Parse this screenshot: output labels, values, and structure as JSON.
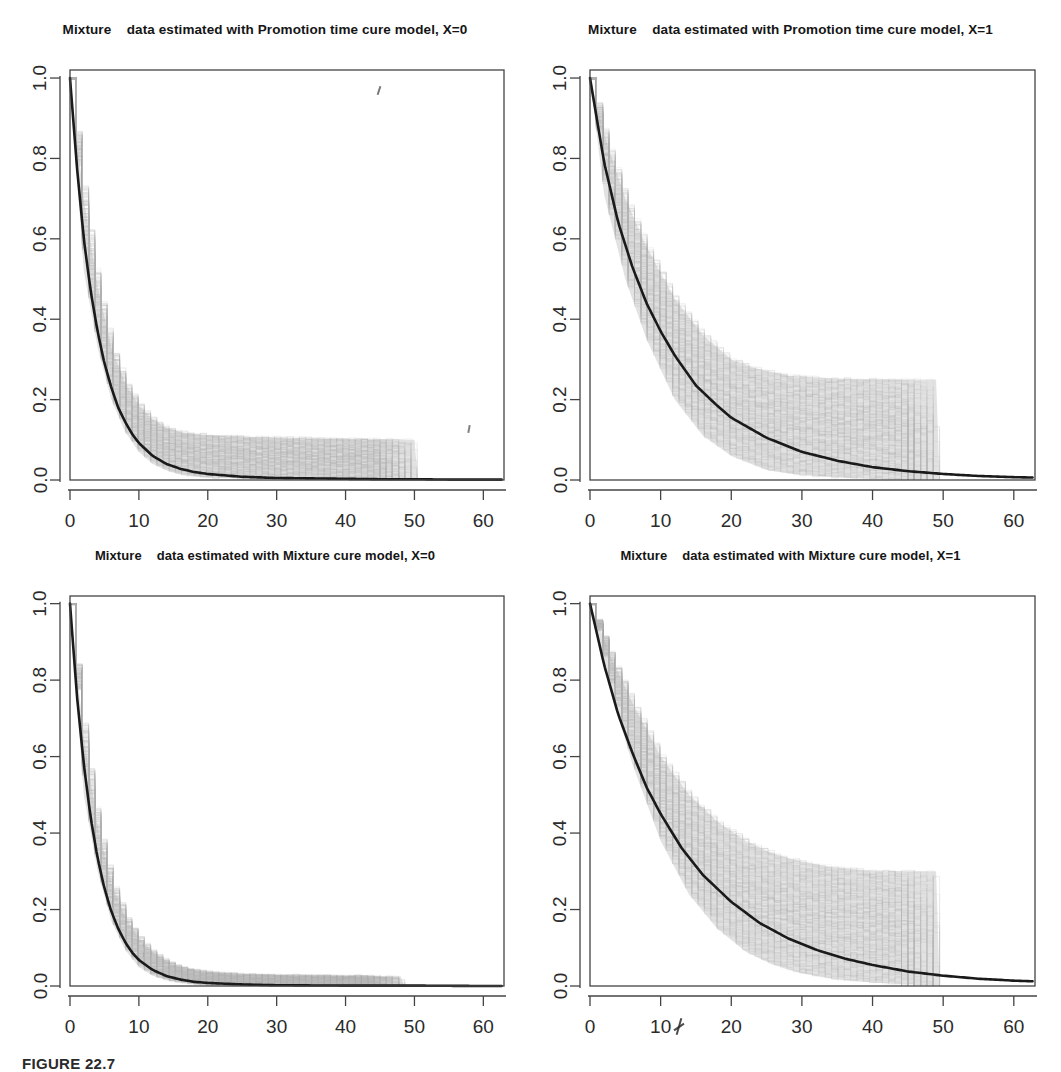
{
  "figure": {
    "caption": "FIGURE 22.7",
    "axis_labels": {
      "x_ticks": [
        "0",
        "10",
        "20",
        "30",
        "40",
        "50",
        "60"
      ],
      "y_ticks": [
        "0.0",
        "0.2",
        "0.4",
        "0.6",
        "0.8",
        "1.0"
      ]
    },
    "colors": {
      "curve": "#1a1a1a",
      "band": "#b9b9b9",
      "axis": "#444444",
      "background": "#ffffff"
    }
  },
  "panels": [
    {
      "id": "promotion-x0",
      "title": "Mixture    data estimated with Promotion time cure model, X=0"
    },
    {
      "id": "promotion-x1",
      "title": "Mixture    data estimated with Promotion time cure model, X=1"
    },
    {
      "id": "mixture-x0",
      "title": "Mixture    data estimated with Mixture cure model, X=0"
    },
    {
      "id": "mixture-x1",
      "title": "Mixture    data estimated with Mixture cure model, X=1"
    }
  ],
  "chart_data": [
    {
      "type": "line",
      "title": "Mixture    data estimated with Promotion time cure model, X=0",
      "xlabel": "",
      "ylabel": "",
      "xlim": [
        0,
        63
      ],
      "ylim": [
        0,
        1.02
      ],
      "xticks": [
        0,
        10,
        20,
        30,
        40,
        50,
        60
      ],
      "yticks": [
        0.0,
        0.2,
        0.4,
        0.6,
        0.8,
        1.0
      ],
      "grid": false,
      "legend": "none",
      "series": [
        {
          "name": "Fitted survival curve",
          "style": "solid-black",
          "x": [
            0,
            1,
            2,
            3,
            4,
            5,
            6,
            7,
            8,
            9,
            10,
            12,
            14,
            16,
            18,
            20,
            25,
            30,
            35,
            40,
            45,
            50,
            55,
            60,
            63
          ],
          "values": [
            1.0,
            0.78,
            0.6,
            0.47,
            0.37,
            0.29,
            0.23,
            0.18,
            0.145,
            0.115,
            0.092,
            0.06,
            0.04,
            0.028,
            0.02,
            0.015,
            0.008,
            0.005,
            0.004,
            0.003,
            0.002,
            0.002,
            0.001,
            0.001,
            0.001
          ]
        },
        {
          "name": "Bootstrap band upper",
          "style": "grey-envelope",
          "x": [
            0,
            2,
            4,
            6,
            8,
            10,
            12,
            14,
            16,
            18,
            20,
            25,
            30,
            35,
            40,
            45,
            50,
            50.5,
            63
          ],
          "values": [
            1.0,
            0.7,
            0.48,
            0.33,
            0.24,
            0.185,
            0.15,
            0.13,
            0.12,
            0.115,
            0.112,
            0.108,
            0.106,
            0.104,
            0.103,
            0.102,
            0.1,
            0.0,
            0.0
          ]
        },
        {
          "name": "Bootstrap band lower",
          "style": "grey-envelope",
          "x": [
            0,
            2,
            4,
            6,
            8,
            10,
            12,
            14,
            16,
            18,
            20,
            30,
            40,
            50,
            63
          ],
          "values": [
            1.0,
            0.52,
            0.33,
            0.2,
            0.12,
            0.07,
            0.04,
            0.024,
            0.014,
            0.009,
            0.006,
            0.002,
            0.001,
            0.0,
            0.0
          ]
        }
      ],
      "annotations": [
        "grey bootstrap replicate step-curves truncate at t = 50"
      ]
    },
    {
      "type": "line",
      "title": "Mixture    data estimated with Promotion time cure model, X=1",
      "xlabel": "",
      "ylabel": "",
      "xlim": [
        0,
        63
      ],
      "ylim": [
        0,
        1.02
      ],
      "xticks": [
        0,
        10,
        20,
        30,
        40,
        50,
        60
      ],
      "yticks": [
        0.0,
        0.2,
        0.4,
        0.6,
        0.8,
        1.0
      ],
      "grid": false,
      "legend": "none",
      "series": [
        {
          "name": "Fitted survival curve",
          "style": "solid-black",
          "x": [
            0,
            2,
            4,
            6,
            8,
            10,
            12,
            15,
            18,
            20,
            25,
            30,
            35,
            40,
            45,
            50,
            55,
            60,
            63
          ],
          "values": [
            1.0,
            0.79,
            0.64,
            0.53,
            0.44,
            0.37,
            0.31,
            0.235,
            0.185,
            0.155,
            0.105,
            0.07,
            0.048,
            0.032,
            0.022,
            0.015,
            0.01,
            0.007,
            0.006
          ]
        },
        {
          "name": "Bootstrap band upper",
          "style": "grey-envelope",
          "x": [
            0,
            2,
            5,
            8,
            12,
            16,
            20,
            24,
            28,
            32,
            36,
            40,
            45,
            49,
            49.5,
            63
          ],
          "values": [
            1.0,
            0.86,
            0.7,
            0.58,
            0.45,
            0.36,
            0.3,
            0.275,
            0.26,
            0.255,
            0.252,
            0.25,
            0.25,
            0.25,
            0.0,
            0.0
          ]
        },
        {
          "name": "Bootstrap band lower",
          "style": "grey-envelope",
          "x": [
            0,
            2,
            5,
            8,
            12,
            16,
            20,
            25,
            30,
            35,
            40,
            50,
            63
          ],
          "values": [
            1.0,
            0.71,
            0.5,
            0.35,
            0.2,
            0.11,
            0.06,
            0.025,
            0.012,
            0.006,
            0.003,
            0.0,
            0.0
          ]
        }
      ],
      "annotations": [
        "grey bootstrap replicate step-curves plateau near 0.25 and truncate at t = 49"
      ]
    },
    {
      "type": "line",
      "title": "Mixture    data estimated with Mixture cure model, X=0",
      "xlabel": "",
      "ylabel": "",
      "xlim": [
        0,
        63
      ],
      "ylim": [
        0,
        1.02
      ],
      "xticks": [
        0,
        10,
        20,
        30,
        40,
        50,
        60
      ],
      "yticks": [
        0.0,
        0.2,
        0.4,
        0.6,
        0.8,
        1.0
      ],
      "grid": false,
      "legend": "none",
      "series": [
        {
          "name": "Fitted survival curve",
          "style": "solid-black",
          "x": [
            0,
            1,
            2,
            3,
            4,
            5,
            6,
            7,
            8,
            9,
            10,
            12,
            14,
            16,
            18,
            20,
            25,
            30,
            40,
            50,
            60,
            63
          ],
          "values": [
            1.0,
            0.76,
            0.58,
            0.44,
            0.335,
            0.255,
            0.195,
            0.15,
            0.115,
            0.088,
            0.068,
            0.042,
            0.026,
            0.017,
            0.011,
            0.008,
            0.004,
            0.002,
            0.001,
            0.001,
            0.0,
            0.0
          ]
        },
        {
          "name": "Bootstrap band upper",
          "style": "grey-envelope",
          "x": [
            0,
            2,
            4,
            6,
            8,
            10,
            12,
            14,
            16,
            18,
            20,
            25,
            30,
            35,
            40,
            45,
            48,
            48.5,
            63
          ],
          "values": [
            1.0,
            0.65,
            0.42,
            0.27,
            0.18,
            0.125,
            0.088,
            0.065,
            0.05,
            0.042,
            0.037,
            0.031,
            0.029,
            0.028,
            0.027,
            0.026,
            0.025,
            0.0,
            0.0
          ]
        },
        {
          "name": "Bootstrap band lower",
          "style": "grey-envelope",
          "x": [
            0,
            2,
            4,
            6,
            8,
            10,
            12,
            14,
            16,
            18,
            20,
            25,
            30,
            40,
            63
          ],
          "values": [
            1.0,
            0.5,
            0.3,
            0.17,
            0.095,
            0.05,
            0.027,
            0.015,
            0.009,
            0.005,
            0.003,
            0.001,
            0.001,
            0.0,
            0.0
          ]
        }
      ],
      "annotations": [
        "narrow grey bootstrap band; replicates truncate near t = 48"
      ]
    },
    {
      "type": "line",
      "title": "Mixture    data estimated with Mixture cure model, X=1",
      "xlabel": "",
      "ylabel": "",
      "xlim": [
        0,
        63
      ],
      "ylim": [
        0,
        1.02
      ],
      "xticks": [
        0,
        10,
        20,
        30,
        40,
        50,
        60
      ],
      "yticks": [
        0.0,
        0.2,
        0.4,
        0.6,
        0.8,
        1.0
      ],
      "grid": false,
      "legend": "none",
      "series": [
        {
          "name": "Fitted survival curve",
          "style": "solid-black",
          "x": [
            0,
            2,
            4,
            6,
            8,
            10,
            13,
            16,
            20,
            24,
            28,
            32,
            36,
            40,
            45,
            50,
            55,
            60,
            63
          ],
          "values": [
            1.0,
            0.84,
            0.71,
            0.61,
            0.52,
            0.45,
            0.36,
            0.29,
            0.22,
            0.165,
            0.125,
            0.095,
            0.072,
            0.055,
            0.038,
            0.027,
            0.019,
            0.014,
            0.012
          ]
        },
        {
          "name": "Bootstrap band upper",
          "style": "grey-envelope",
          "x": [
            0,
            3,
            6,
            10,
            14,
            18,
            22,
            26,
            30,
            34,
            38,
            42,
            46,
            49,
            49.5,
            63
          ],
          "values": [
            1.0,
            0.86,
            0.74,
            0.6,
            0.5,
            0.43,
            0.38,
            0.345,
            0.325,
            0.312,
            0.305,
            0.3,
            0.3,
            0.3,
            0.0,
            0.0
          ]
        },
        {
          "name": "Bootstrap band lower",
          "style": "grey-envelope",
          "x": [
            0,
            3,
            6,
            10,
            14,
            18,
            22,
            26,
            30,
            35,
            40,
            45,
            50,
            63
          ],
          "values": [
            1.0,
            0.77,
            0.58,
            0.38,
            0.24,
            0.15,
            0.09,
            0.055,
            0.033,
            0.017,
            0.009,
            0.004,
            0.0,
            0.0
          ]
        }
      ],
      "annotations": [
        "widest grey bootstrap band; replicates plateau near 0.3 and truncate at t = 50"
      ]
    }
  ]
}
